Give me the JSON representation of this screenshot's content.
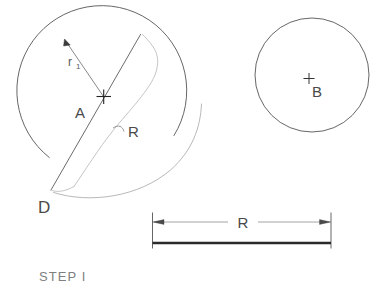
{
  "page": {
    "background_color": "#ffffff",
    "title_caption": "STEP I",
    "line_color_dark": "#555555",
    "line_color_light": "#b9b9b9",
    "text_color": "#4a4a4a",
    "caption_color": "#808080"
  },
  "figures": {
    "left_circle": {
      "name": "circle-A",
      "center_label": "A",
      "center_marker": "cross-mark",
      "radius_label": "r",
      "radius_label_subscript": "1",
      "sweep_radius_label": "R",
      "pivot_point_label": "D",
      "center_x": 104,
      "center_y": 97,
      "radius": 85
    },
    "right_circle": {
      "name": "circle-B",
      "center_label": "B",
      "center_marker": "cross-mark",
      "center_x": 312,
      "center_y": 75,
      "radius": 57
    },
    "dimension": {
      "name": "dimension-R",
      "label": "R",
      "left_x": 152,
      "right_x": 331,
      "dim_line_y": 226,
      "bar_y": 243,
      "arrow_style": "double-arrow"
    }
  },
  "annotations": [
    {
      "id": "r1",
      "text": "r",
      "subscript": "1"
    },
    {
      "id": "A",
      "text": "A"
    },
    {
      "id": "R-leader",
      "text": "R"
    },
    {
      "id": "D",
      "text": "D"
    },
    {
      "id": "B",
      "text": "B"
    },
    {
      "id": "R-dim",
      "text": "R"
    },
    {
      "id": "step",
      "text": "STEP I"
    }
  ]
}
